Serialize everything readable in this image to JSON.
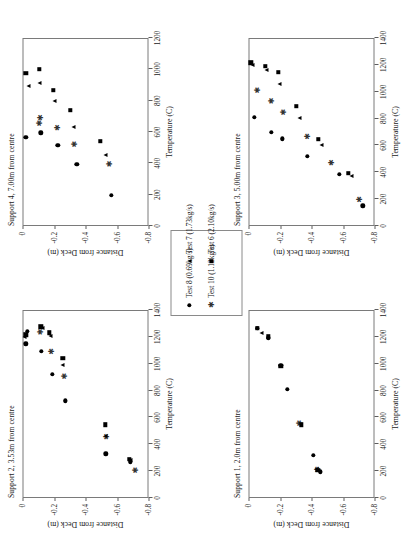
{
  "figure": {
    "axis_titles": {
      "x": "Temperature (C)",
      "y": "Distance from Deck (m)"
    },
    "legend": {
      "entries": [
        {
          "label": "Test 8 (0.69kg/s)",
          "marker": "circle-marker",
          "glyph": "●"
        },
        {
          "label": "Test 10 (1.12kg/s)",
          "marker": "star-marker",
          "glyph": "✱"
        },
        {
          "label": "Test 7 (1.73kg/s)",
          "marker": "triangle-marker",
          "glyph": "▲"
        },
        {
          "label": "Test 6 (2.10kg/s)",
          "marker": "square-marker",
          "glyph": "■"
        }
      ]
    }
  },
  "chart_data": [
    {
      "id": "support-2",
      "type": "scatter",
      "title": "Support 2, 3.53m from centre",
      "xlabel": "Temperature (C)",
      "ylabel": "Distance from Deck (m)",
      "xlim": [
        0,
        1400
      ],
      "ylim": [
        -0.8,
        0
      ],
      "xticks": [
        0,
        200,
        400,
        600,
        800,
        1000,
        1200,
        1400
      ],
      "yticks": [
        0,
        -0.2,
        -0.4,
        -0.6,
        -0.8
      ],
      "grid": false,
      "series": [
        {
          "name": "Test 8 (0.69kg/s)",
          "marker": "circle",
          "points": [
            [
              1150,
              -0.02
            ],
            [
              1240,
              -0.03
            ],
            [
              1095,
              -0.12
            ],
            [
              920,
              -0.19
            ],
            [
              725,
              -0.27
            ],
            [
              330,
              -0.53
            ],
            [
              270,
              -0.685
            ]
          ]
        },
        {
          "name": "Test 10 (1.12kg/s)",
          "marker": "star",
          "points": [
            [
              1235,
              -0.115
            ],
            [
              1090,
              -0.185
            ],
            [
              905,
              -0.265
            ],
            [
              455,
              -0.535
            ],
            [
              205,
              -0.715
            ]
          ]
        },
        {
          "name": "Test 7 (1.73kg/s)",
          "marker": "tri",
          "points": [
            [
              1200,
              -0.015
            ],
            [
              1265,
              -0.125
            ],
            [
              1210,
              -0.175
            ],
            [
              990,
              -0.255
            ],
            [
              465,
              -0.53
            ],
            [
              285,
              -0.685
            ]
          ]
        },
        {
          "name": "Test 6 (2.10kg/s)",
          "marker": "square",
          "points": [
            [
              1215,
              -0.02
            ],
            [
              1275,
              -0.115
            ],
            [
              1230,
              -0.17
            ],
            [
              1040,
              -0.255
            ],
            [
              545,
              -0.525
            ],
            [
              290,
              -0.68
            ]
          ]
        }
      ]
    },
    {
      "id": "support-4",
      "type": "scatter",
      "title": "Support 4, 7.00m from centre",
      "xlabel": "Temperature (C)",
      "ylabel": "Distance from Deck (m)",
      "xlim": [
        0,
        1200
      ],
      "ylim": [
        -0.8,
        0
      ],
      "xticks": [
        0,
        200,
        400,
        600,
        800,
        1000,
        1200
      ],
      "yticks": [
        0,
        -0.2,
        -0.4,
        -0.6,
        -0.8
      ],
      "grid": false,
      "series": [
        {
          "name": "Test 8 (0.69kg/s)",
          "marker": "circle",
          "points": [
            [
              565,
              -0.02
            ],
            [
              595,
              -0.115
            ],
            [
              515,
              -0.225
            ],
            [
              395,
              -0.345
            ],
            [
              195,
              -0.565
            ]
          ]
        },
        {
          "name": "Test 10 (1.12kg/s)",
          "marker": "star",
          "points": [
            [
              655,
              -0.105
            ],
            [
              690,
              -0.115
            ],
            [
              625,
              -0.225
            ],
            [
              520,
              -0.33
            ],
            [
              395,
              -0.555
            ]
          ]
        },
        {
          "name": "Test 7 (1.73kg/s)",
          "marker": "tri",
          "points": [
            [
              895,
              -0.035
            ],
            [
              915,
              -0.105
            ],
            [
              800,
              -0.205
            ],
            [
              635,
              -0.325
            ],
            [
              455,
              -0.525
            ]
          ]
        },
        {
          "name": "Test 6 (2.10kg/s)",
          "marker": "square",
          "points": [
            [
              975,
              -0.02
            ],
            [
              1000,
              -0.105
            ],
            [
              865,
              -0.195
            ],
            [
              740,
              -0.305
            ],
            [
              540,
              -0.495
            ]
          ]
        }
      ]
    },
    {
      "id": "support-1",
      "type": "scatter",
      "title": "Support 1, 2.0m from centre",
      "xlabel": "Temperature (C)",
      "ylabel": "Distance from Deck (m)",
      "xlim": [
        0,
        1400
      ],
      "ylim": [
        -0.8,
        0
      ],
      "xticks": [
        0,
        200,
        400,
        600,
        800,
        1000,
        1200,
        1400
      ],
      "yticks": [
        0,
        -0.2,
        -0.4,
        -0.6,
        -0.8
      ],
      "grid": false,
      "series": [
        {
          "name": "Test 8 (0.69kg/s)",
          "marker": "circle",
          "points": [
            [
              1265,
              -0.055
            ],
            [
              1195,
              -0.125
            ],
            [
              990,
              -0.205
            ],
            [
              810,
              -0.245
            ],
            [
              320,
              -0.41
            ],
            [
              195,
              -0.455
            ]
          ]
        },
        {
          "name": "Test 10 (1.12kg/s)",
          "marker": "star",
          "points": [
            [
              555,
              -0.325
            ],
            [
              210,
              -0.435
            ]
          ]
        },
        {
          "name": "Test 7 (1.73kg/s)",
          "marker": "tri",
          "points": [
            [
              1225,
              -0.085
            ],
            [
              985,
              -0.205
            ],
            [
              215,
              -0.43
            ]
          ]
        },
        {
          "name": "Test 6 (2.10kg/s)",
          "marker": "square",
          "points": [
            [
              1265,
              -0.055
            ],
            [
              1200,
              -0.125
            ],
            [
              980,
              -0.205
            ],
            [
              545,
              -0.335
            ],
            [
              205,
              -0.44
            ]
          ]
        }
      ]
    },
    {
      "id": "support-3",
      "type": "scatter",
      "title": "Support 3, 5.00m from centre",
      "xlabel": "Temperature (C)",
      "ylabel": "Distance from Deck (m)",
      "xlim": [
        0,
        1400
      ],
      "ylim": [
        -0.8,
        0
      ],
      "xticks": [
        0,
        200,
        400,
        600,
        800,
        1000,
        1200,
        1400
      ],
      "yticks": [
        0,
        -0.2,
        -0.4,
        -0.6,
        -0.8
      ],
      "grid": false,
      "series": [
        {
          "name": "Test 8 (0.69kg/s)",
          "marker": "circle",
          "points": [
            [
              810,
              -0.035
            ],
            [
              700,
              -0.145
            ],
            [
              650,
              -0.215
            ],
            [
              520,
              -0.375
            ],
            [
              385,
              -0.575
            ],
            [
              150,
              -0.725
            ]
          ]
        },
        {
          "name": "Test 10 (1.12kg/s)",
          "marker": "star",
          "points": [
            [
              1010,
              -0.055
            ],
            [
              930,
              -0.145
            ],
            [
              845,
              -0.225
            ],
            [
              665,
              -0.375
            ],
            [
              470,
              -0.525
            ],
            [
              195,
              -0.705
            ]
          ]
        },
        {
          "name": "Test 7 (1.73kg/s)",
          "marker": "tri",
          "points": [
            [
              1200,
              -0.025
            ],
            [
              1165,
              -0.115
            ],
            [
              1060,
              -0.195
            ],
            [
              805,
              -0.325
            ],
            [
              600,
              -0.465
            ],
            [
              375,
              -0.655
            ]
          ]
        },
        {
          "name": "Test 6 (2.10kg/s)",
          "marker": "square",
          "points": [
            [
              1215,
              -0.015
            ],
            [
              1190,
              -0.105
            ],
            [
              1145,
              -0.19
            ],
            [
              890,
              -0.305
            ],
            [
              645,
              -0.445
            ],
            [
              395,
              -0.635
            ]
          ]
        }
      ]
    }
  ]
}
